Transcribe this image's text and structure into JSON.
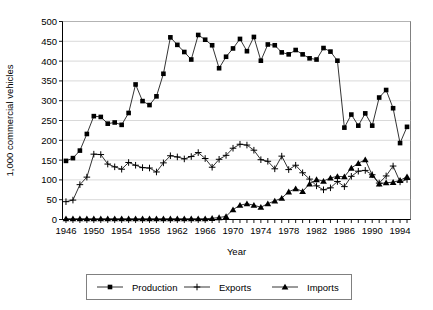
{
  "chart_data": {
    "type": "line",
    "title": "",
    "xlabel": "Year",
    "ylabel": "1,000 commercial vehicles",
    "xlim": [
      1945.5,
      1995.5
    ],
    "ylim": [
      0,
      500
    ],
    "ytick_step": 50,
    "xtick_step": 1,
    "xtick_label_step": 4,
    "grid": true,
    "legend_position": "bottom",
    "x": [
      1946,
      1947,
      1948,
      1949,
      1950,
      1951,
      1952,
      1953,
      1954,
      1955,
      1956,
      1957,
      1958,
      1959,
      1960,
      1961,
      1962,
      1963,
      1964,
      1965,
      1966,
      1967,
      1968,
      1969,
      1970,
      1971,
      1972,
      1973,
      1974,
      1975,
      1976,
      1977,
      1978,
      1979,
      1980,
      1981,
      1982,
      1983,
      1984,
      1985,
      1986,
      1987,
      1988,
      1989,
      1990,
      1991,
      1992,
      1993,
      1994,
      1995
    ],
    "xticklabels": [
      "1946",
      "1950",
      "1954",
      "1958",
      "1962",
      "1966",
      "1970",
      "1974",
      "1978",
      "1982",
      "1986",
      "1990",
      "1994"
    ],
    "yticklabels": [
      "0",
      "50",
      "100",
      "150",
      "200",
      "250",
      "300",
      "350",
      "400",
      "450",
      "500"
    ],
    "series": [
      {
        "name": "Production",
        "marker": "square",
        "values": [
          148,
          155,
          174,
          216,
          261,
          259,
          242,
          245,
          239,
          269,
          341,
          299,
          289,
          311,
          368,
          460,
          441,
          423,
          404,
          466,
          454,
          440,
          382,
          411,
          432,
          456,
          425,
          461,
          401,
          442,
          440,
          422,
          417,
          428,
          417,
          407,
          404,
          433,
          424,
          401,
          232,
          265,
          237,
          268,
          237,
          308,
          327,
          281,
          193,
          234
        ]
      },
      {
        "name": "Exports",
        "marker": "plus",
        "values": [
          45,
          49,
          88,
          107,
          165,
          164,
          140,
          133,
          127,
          144,
          137,
          131,
          130,
          120,
          143,
          161,
          158,
          153,
          159,
          169,
          154,
          132,
          152,
          162,
          180,
          190,
          188,
          175,
          151,
          147,
          128,
          160,
          126,
          137,
          118,
          102,
          85,
          75,
          80,
          96,
          83,
          109,
          122,
          124,
          113,
          92,
          110,
          135,
          95,
          101
        ]
      },
      {
        "name": "Imports",
        "marker": "triangle",
        "values": [
          2,
          2,
          2,
          2,
          2,
          2,
          2,
          2,
          2,
          2,
          2,
          2,
          2,
          2,
          2,
          2,
          2,
          2,
          2,
          2,
          2,
          3,
          5,
          8,
          25,
          36,
          40,
          36,
          31,
          40,
          47,
          54,
          70,
          78,
          71,
          90,
          101,
          97,
          105,
          109,
          108,
          130,
          142,
          151,
          112,
          90,
          93,
          94,
          99,
          108
        ]
      }
    ]
  },
  "axes": {
    "y_title": "1,000 commercial vehicles",
    "x_title": "Year"
  },
  "legend": {
    "items": [
      {
        "label": "Production",
        "marker": "square"
      },
      {
        "label": "Exports",
        "marker": "plus"
      },
      {
        "label": "Imports",
        "marker": "triangle"
      }
    ]
  }
}
